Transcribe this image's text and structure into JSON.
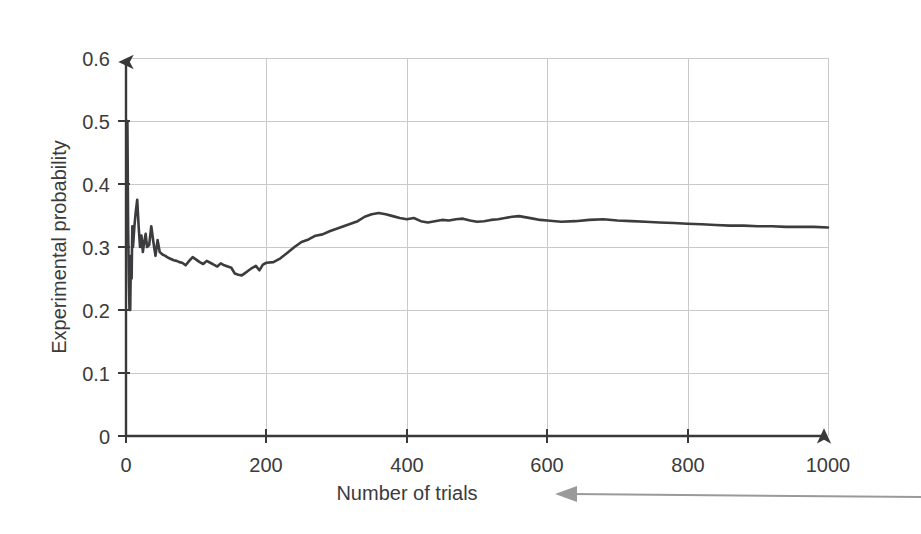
{
  "chart_data": {
    "type": "line",
    "title": "",
    "xlabel": "Number of trials",
    "ylabel": "Experimental probability",
    "xlim": [
      0,
      1000
    ],
    "ylim": [
      0,
      0.6
    ],
    "grid": true,
    "legend": null,
    "x_ticks": [
      "0",
      "200",
      "400",
      "600",
      "800",
      "1000"
    ],
    "x_tick_values": [
      0,
      200,
      400,
      600,
      800,
      1000
    ],
    "y_ticks": [
      "0",
      "0.1",
      "0.2",
      "0.3",
      "0.4",
      "0.5",
      "0.6"
    ],
    "y_tick_values": [
      0,
      0.1,
      0.2,
      0.3,
      0.4,
      0.5,
      0.6
    ],
    "series": [
      {
        "name": "Experimental probability",
        "color": "#3c3c3e",
        "x": [
          1,
          2,
          3,
          4,
          5,
          6,
          7,
          8,
          9,
          10,
          12,
          14,
          16,
          18,
          20,
          22,
          24,
          26,
          28,
          30,
          33,
          36,
          39,
          42,
          45,
          48,
          52,
          56,
          60,
          64,
          68,
          72,
          76,
          80,
          85,
          90,
          95,
          100,
          105,
          110,
          115,
          120,
          125,
          130,
          135,
          140,
          145,
          150,
          155,
          160,
          165,
          170,
          175,
          180,
          185,
          190,
          195,
          200,
          210,
          220,
          230,
          240,
          250,
          260,
          270,
          280,
          290,
          300,
          310,
          320,
          330,
          340,
          350,
          360,
          370,
          380,
          390,
          400,
          410,
          420,
          430,
          440,
          450,
          460,
          470,
          480,
          490,
          500,
          510,
          520,
          530,
          540,
          550,
          560,
          570,
          580,
          590,
          600,
          620,
          640,
          660,
          680,
          700,
          720,
          740,
          760,
          780,
          800,
          820,
          840,
          860,
          880,
          900,
          920,
          940,
          960,
          980,
          1000
        ],
        "y": [
          0.5,
          0.5,
          0.333,
          0.25,
          0.2,
          0.2,
          0.286,
          0.25,
          0.333,
          0.3,
          0.333,
          0.357,
          0.375,
          0.333,
          0.3,
          0.318,
          0.292,
          0.308,
          0.321,
          0.3,
          0.303,
          0.333,
          0.308,
          0.286,
          0.311,
          0.292,
          0.288,
          0.286,
          0.283,
          0.281,
          0.279,
          0.278,
          0.276,
          0.275,
          0.271,
          0.278,
          0.284,
          0.28,
          0.276,
          0.273,
          0.278,
          0.275,
          0.272,
          0.269,
          0.274,
          0.271,
          0.269,
          0.267,
          0.258,
          0.256,
          0.255,
          0.259,
          0.263,
          0.267,
          0.27,
          0.263,
          0.272,
          0.275,
          0.276,
          0.282,
          0.291,
          0.3,
          0.308,
          0.312,
          0.318,
          0.32,
          0.325,
          0.329,
          0.333,
          0.337,
          0.341,
          0.348,
          0.352,
          0.354,
          0.352,
          0.349,
          0.346,
          0.344,
          0.346,
          0.341,
          0.339,
          0.341,
          0.343,
          0.342,
          0.344,
          0.345,
          0.342,
          0.34,
          0.341,
          0.343,
          0.344,
          0.346,
          0.348,
          0.349,
          0.347,
          0.345,
          0.343,
          0.342,
          0.34,
          0.341,
          0.343,
          0.344,
          0.342,
          0.341,
          0.34,
          0.339,
          0.338,
          0.337,
          0.336,
          0.335,
          0.334,
          0.334,
          0.333,
          0.333,
          0.332,
          0.332,
          0.332,
          0.331
        ]
      }
    ],
    "annotation": {
      "text": "Number of trials",
      "arrow_direction": "left"
    }
  },
  "axis": {
    "y_title": "Experimental probability",
    "x_title": "Number of trials"
  },
  "icons": {
    "y_axis_arrow": "arrow-up-icon",
    "x_axis_arrow": "arrow-right-icon",
    "callout_arrow": "arrow-left-icon"
  }
}
